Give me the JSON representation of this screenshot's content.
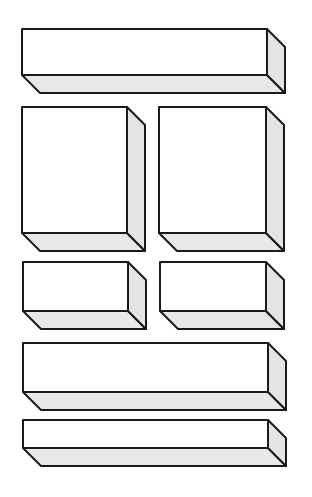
{
  "diagram": {
    "title": "",
    "width": 312,
    "height": 497,
    "colors": {
      "background": "#ffffff",
      "front_face": "#ffffff",
      "side_face": "#e4e4e4",
      "bottom_face": "#e8e8e8",
      "outline": "#1a1a1a"
    },
    "depth": {
      "dx": 18,
      "dy": 18
    },
    "boxes": [
      {
        "id": "box-1",
        "row": 1,
        "x": 22,
        "y": 29,
        "w": 245,
        "h": 46
      },
      {
        "id": "box-2",
        "row": 2,
        "x": 22,
        "y": 107,
        "w": 105,
        "h": 126
      },
      {
        "id": "box-3",
        "row": 2,
        "x": 159,
        "y": 107,
        "w": 107,
        "h": 126
      },
      {
        "id": "box-4",
        "row": 3,
        "x": 23,
        "y": 262,
        "w": 105,
        "h": 49
      },
      {
        "id": "box-5",
        "row": 3,
        "x": 160,
        "y": 262,
        "w": 106,
        "h": 49
      },
      {
        "id": "box-6",
        "row": 4,
        "x": 23,
        "y": 343,
        "w": 245,
        "h": 49
      },
      {
        "id": "box-7",
        "row": 5,
        "x": 23,
        "y": 420,
        "w": 245,
        "h": 28
      }
    ]
  }
}
